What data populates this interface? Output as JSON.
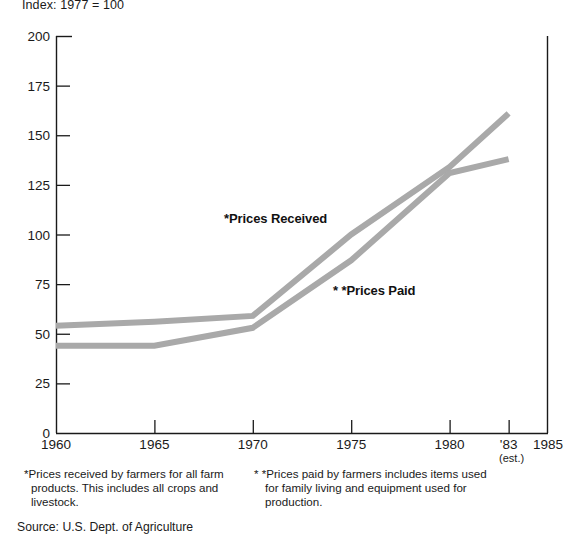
{
  "chart_data": {
    "type": "line",
    "title": "Index: 1977 = 100",
    "xlabel": "",
    "ylabel": "",
    "x": [
      1960,
      1965,
      1970,
      1975,
      1980,
      1983
    ],
    "xlim": [
      1960,
      1985
    ],
    "ylim": [
      0,
      200
    ],
    "grid": false,
    "legend_position": "inline-annotations",
    "x_tick_labels": [
      "1960",
      "1965",
      "1970",
      "1975",
      "1980",
      "'83",
      "1985"
    ],
    "x_tick_values": [
      1960,
      1965,
      1970,
      1975,
      1980,
      1983,
      1985
    ],
    "x_tick_sublabel": "(est.)",
    "y_tick_labels": [
      "0",
      "25",
      "50",
      "75",
      "100",
      "125",
      "150",
      "175",
      "200"
    ],
    "y_tick_values": [
      0,
      25,
      50,
      75,
      100,
      125,
      150,
      175,
      200
    ],
    "series": [
      {
        "name": "*Prices Received",
        "color": "#a9a9a9",
        "values": [
          54,
          56,
          59,
          100,
          134,
          161
        ]
      },
      {
        "name": "**Prices Paid",
        "color": "#a9a9a9",
        "values": [
          44,
          44,
          53,
          87,
          131,
          138
        ]
      }
    ],
    "annotations": [
      {
        "text": "*Prices Received",
        "x": 1971.6,
        "y": 108
      },
      {
        "text": "**Prices Paid",
        "x": 1977.5,
        "y": 72
      }
    ]
  },
  "title": {
    "text": "Index: 1977 = 100"
  },
  "series_labels": {
    "received": "*Prices Received",
    "paid": "* *Prices Paid"
  },
  "footnotes": {
    "left": "*Prices received by farmers for all farm products. This includes all crops and livestock.",
    "right": "* *Prices paid by farmers includes items used for family living and equipment used for production.",
    "source": "Source: U.S. Dept. of Agriculture"
  },
  "colors": {
    "line": "#a9a9a9",
    "axis": "#1a1a1a",
    "text": "#1a1a1a",
    "background": "#ffffff"
  }
}
